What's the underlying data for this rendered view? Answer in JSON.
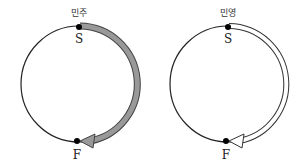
{
  "diagrams": [
    {
      "name": "민주",
      "start_label": "S",
      "finish_label": "F",
      "arrow_style": "filled",
      "arrow_color": "#8c8c8c"
    },
    {
      "name": "민영",
      "start_label": "S",
      "finish_label": "F",
      "arrow_style": "hollow",
      "arrow_color": "#ffffff"
    }
  ]
}
